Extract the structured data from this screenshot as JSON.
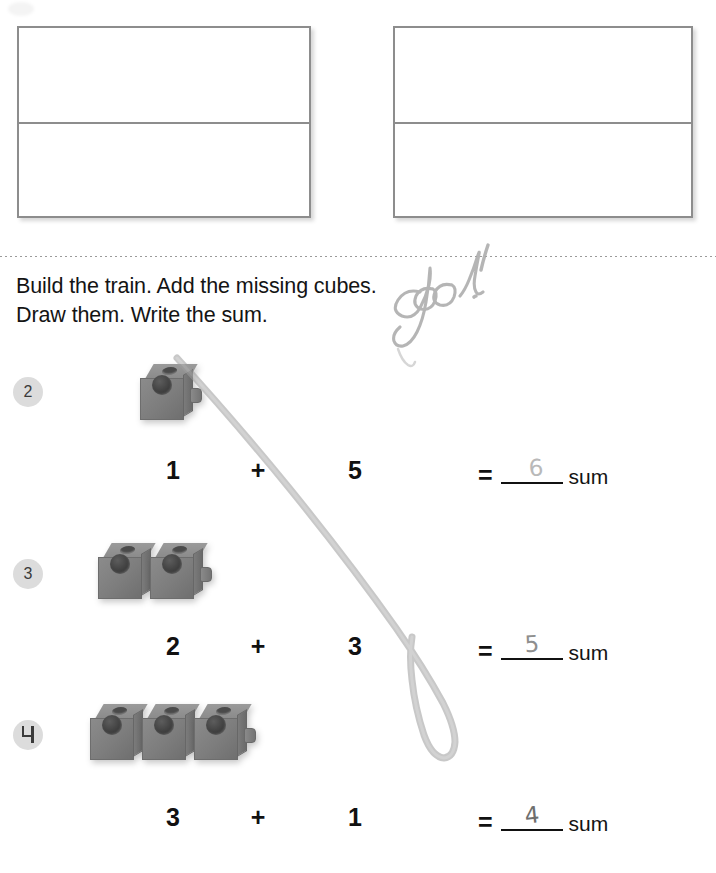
{
  "page": {
    "background": "#ffffff",
    "separator_color": "#9a9a9a",
    "cube_color": "#7d7d7d",
    "badge_color": "#dcdcdc",
    "pencil_color": "#9a9a9a"
  },
  "answer_boxes": [
    {
      "name": "left-answer-box",
      "top_half": "",
      "bottom_half": ""
    },
    {
      "name": "right-answer-box",
      "top_half": "",
      "bottom_half": ""
    }
  ],
  "instructions": {
    "line1": "Build the train. Add the missing cubes.",
    "line2": "Draw them. Write the sum."
  },
  "handwriting": {
    "teacher_note": "good!",
    "has_long_pencil_stroke": true
  },
  "problems": [
    {
      "number": "2",
      "cubes_shown": 1,
      "addend1": "1",
      "addend2": "5",
      "plus": "+",
      "equals": "=",
      "answer": "6",
      "sum_label": "sum"
    },
    {
      "number": "3",
      "cubes_shown": 2,
      "addend1": "2",
      "addend2": "3",
      "plus": "+",
      "equals": "=",
      "answer": "5",
      "sum_label": "sum"
    },
    {
      "number": "4",
      "cubes_shown": 3,
      "addend1": "3",
      "addend2": "1",
      "plus": "+",
      "equals": "=",
      "answer": "4",
      "sum_label": "sum"
    }
  ]
}
